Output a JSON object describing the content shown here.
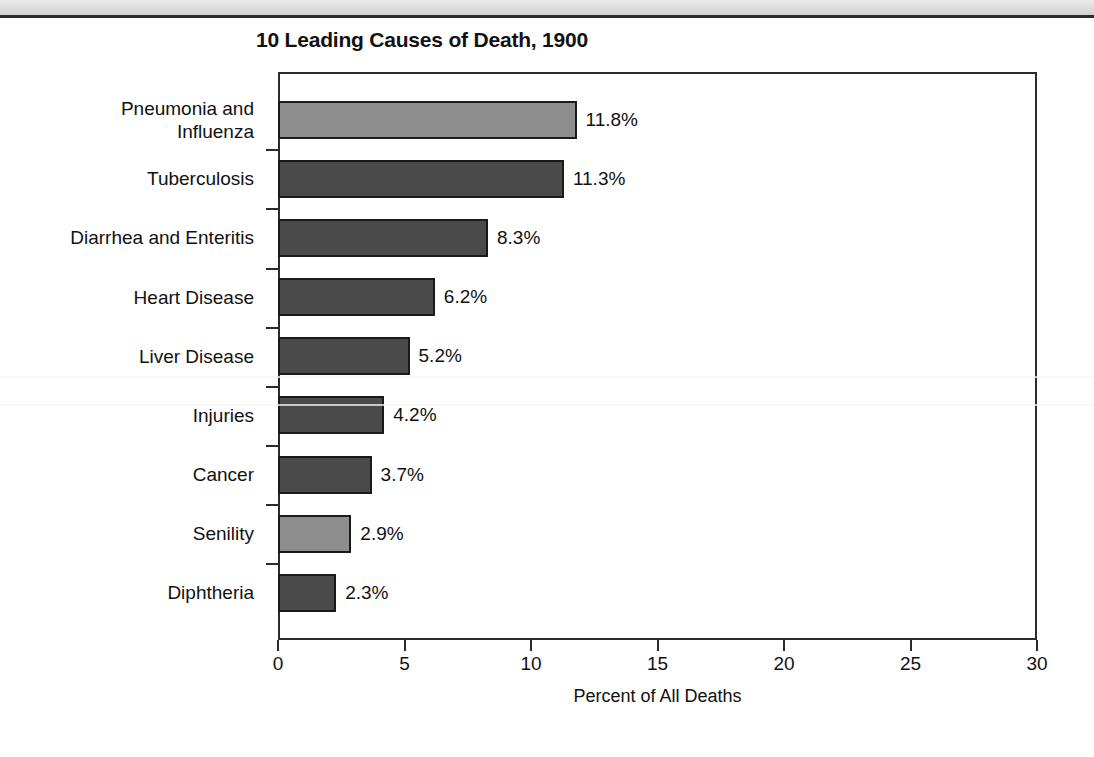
{
  "page": {
    "background_color": "#ffffff",
    "scan_band_color": "#dcdcdc",
    "rule_color": "#2b2b2b"
  },
  "chart_data": {
    "type": "bar",
    "orientation": "horizontal",
    "title": "10 Leading Causes of Death, 1900",
    "xlabel": "Percent of All Deaths",
    "ylabel": "",
    "xlim": [
      0,
      30
    ],
    "xticks": [
      0,
      5,
      10,
      15,
      20,
      25,
      30
    ],
    "xtick_labels": [
      "0",
      "5",
      "10",
      "15",
      "20",
      "25",
      "30"
    ],
    "grid": false,
    "legend": null,
    "value_suffix": "%",
    "categories": [
      "Pneumonia and\nInfluenza",
      "Tuberculosis",
      "Diarrhea and Enteritis",
      "Heart Disease",
      "Liver Disease",
      "Injuries",
      "Cancer",
      "Senility",
      "Diphtheria"
    ],
    "values": [
      11.8,
      11.3,
      8.3,
      6.2,
      5.2,
      4.2,
      3.7,
      2.9,
      2.3
    ],
    "value_labels": [
      "11.8%",
      "11.3%",
      "8.3%",
      "6.2%",
      "5.2%",
      "4.2%",
      "3.7%",
      "2.9%",
      "2.3%"
    ],
    "bar_shades": [
      "light",
      "dark",
      "dark",
      "dark",
      "dark",
      "dark",
      "dark",
      "light",
      "dark"
    ],
    "colors": {
      "bar_dark": "#4a4a4a",
      "bar_light": "#8e8e8e",
      "bar_outline": "#1a1a1a",
      "axis": "#2b2b2b",
      "text": "#111111"
    }
  }
}
